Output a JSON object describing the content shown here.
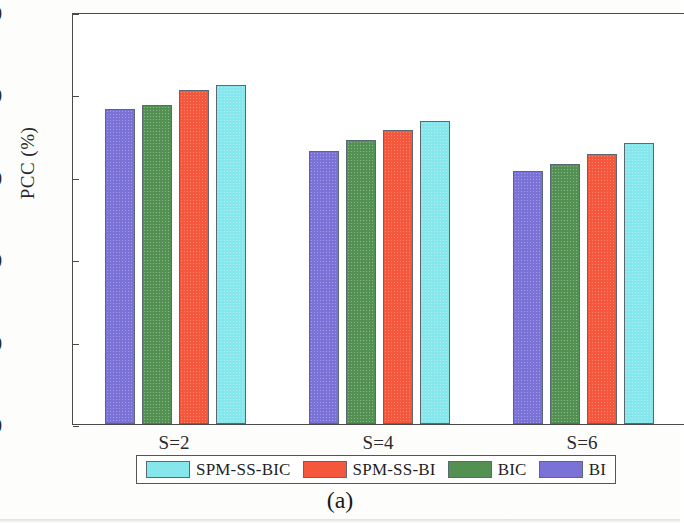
{
  "chart_data": {
    "type": "bar",
    "title": "",
    "subtitle": "",
    "xlabel": "",
    "ylabel": "PCC (%)",
    "categories": [
      "S=2",
      "S=4",
      "S=6"
    ],
    "series": [
      {
        "name": "BI",
        "color": "#7b72d8",
        "values": [
          76.5,
          66.3,
          61.3
        ]
      },
      {
        "name": "BIC",
        "color": "#529152",
        "values": [
          77.5,
          69.0,
          63.0
        ]
      },
      {
        "name": "SPM-SS-BI",
        "color": "#f4573c",
        "values": [
          81.0,
          71.4,
          65.5
        ]
      },
      {
        "name": "SPM-SS-BIC",
        "color": "#85e6ec",
        "values": [
          82.3,
          73.5,
          68.2
        ]
      }
    ],
    "ylim": [
      0,
      100
    ],
    "yticks": [
      0,
      20,
      40,
      60,
      80,
      100
    ],
    "ytick_labels": [
      "0",
      "20",
      "40",
      "60",
      "80",
      "100"
    ],
    "grid": false,
    "legend_position": "below-axes",
    "legend_order": [
      "SPM-SS-BIC",
      "SPM-SS-BI",
      "BIC",
      "BI"
    ]
  },
  "axis": {
    "ylabel": "PCC (%)",
    "ytick_labels": [
      "100",
      "80",
      "60",
      "40",
      "20",
      "0"
    ],
    "xtick_labels": [
      "S=2",
      "S=4",
      "S=6"
    ]
  },
  "legend": {
    "entries": [
      {
        "label": "SPM-SS-BIC",
        "color": "#85e6ec"
      },
      {
        "label": "SPM-SS-BI",
        "color": "#f4573c"
      },
      {
        "label": "BIC",
        "color": "#529152"
      },
      {
        "label": "BI",
        "color": "#7b72d8"
      }
    ]
  },
  "caption": "(a)"
}
